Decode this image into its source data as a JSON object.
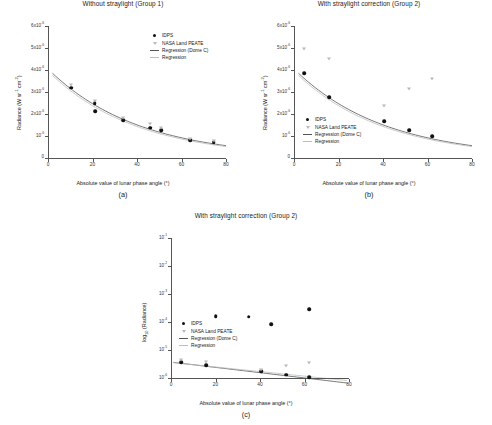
{
  "figure": {
    "panels": [
      {
        "caption": "(a)",
        "title": "Without straylight (Group 1)",
        "xlabel": "Absolute value of lunar phase angle (°)",
        "ylabel_main": "Radiance (W sr",
        "ylabel_sup1": "-1",
        "ylabel_mid": " cm",
        "ylabel_sup2": "-2",
        "ylabel_end": ")",
        "xticks": [
          "0",
          "20",
          "40",
          "60",
          "80"
        ],
        "yticks": [
          "6x10-6",
          "5x10-6",
          "4x10-6",
          "3x10-6",
          "2x10-6",
          "10-6",
          "0"
        ]
      },
      {
        "caption": "(b)",
        "title": "With straylight correction (Group 2)",
        "xlabel": "Absolute value of lunar phase angle (°)",
        "xticks": [
          "0",
          "20",
          "40",
          "60",
          "80"
        ],
        "yticks": [
          "6x10-6",
          "5x10-6",
          "4x10-6",
          "3x10-6",
          "2x10-6",
          "10-6",
          "0"
        ]
      },
      {
        "caption": "(c)",
        "title": "With straylight correction (Group 2)",
        "xlabel": "Absolute value of lunar phase angle (°)",
        "ylabel": "log10 (Radiance)",
        "xticks": [
          "0",
          "20",
          "40",
          "60",
          "80"
        ],
        "yticks": [
          "10-1",
          "10-2",
          "10-3",
          "10-4",
          "10-5",
          "10-6"
        ]
      }
    ],
    "legend": {
      "items": [
        {
          "label": "IDPS",
          "marker": "filled-circle"
        },
        {
          "label": "NASA Land PEATE",
          "marker": "open-triangle"
        },
        {
          "label": "Regression (Dome C)",
          "marker": "line-dark"
        },
        {
          "label": "Regression",
          "marker": "line-light"
        }
      ]
    },
    "colors": {
      "idps": "#111111",
      "peate": "#b9b9b9",
      "regression_dome_c": "#555555",
      "regression": "#bdbdbd",
      "axis": "#555555",
      "background": "#ffffff"
    }
  },
  "chart_data": [
    {
      "type": "scatter",
      "panel": "a",
      "title": "Without straylight (Group 1)",
      "xlabel": "Absolute value of lunar phase angle (°)",
      "ylabel": "Radiance (W sr-1 cm-2)",
      "xlim": [
        0,
        80
      ],
      "ylim": [
        0,
        6e-06
      ],
      "yscale": "linear",
      "grid": false,
      "legend_position": "top-right",
      "series": [
        {
          "name": "IDPS",
          "marker": "filled-circle",
          "points": [
            {
              "x": 10.5,
              "y": 3.2e-06
            },
            {
              "x": 21.0,
              "y": 2.48e-06
            },
            {
              "x": 21.3,
              "y": 2.13e-06
            },
            {
              "x": 33.8,
              "y": 1.73e-06
            },
            {
              "x": 46.0,
              "y": 1.38e-06
            },
            {
              "x": 51.0,
              "y": 1.27e-06
            },
            {
              "x": 63.8,
              "y": 8.2e-07
            },
            {
              "x": 74.5,
              "y": 7.3e-07
            }
          ]
        },
        {
          "name": "NASA Land PEATE",
          "marker": "open-triangle",
          "points": [
            {
              "x": 10.5,
              "y": 3.32e-06
            },
            {
              "x": 21.0,
              "y": 2.6e-06
            },
            {
              "x": 33.8,
              "y": 1.82e-06
            },
            {
              "x": 46.0,
              "y": 1.55e-06
            },
            {
              "x": 51.0,
              "y": 1.37e-06
            },
            {
              "x": 63.8,
              "y": 8.7e-07
            },
            {
              "x": 74.5,
              "y": 7.9e-07
            }
          ]
        }
      ],
      "curves": [
        {
          "name": "Regression (Dome C)",
          "y_at_x0": 4.05e-06,
          "y_at_x80": 5.6e-07
        },
        {
          "name": "Regression",
          "y_at_x0": 3.95e-06,
          "y_at_x80": 5.2e-07
        }
      ]
    },
    {
      "type": "scatter",
      "panel": "b",
      "title": "With straylight correction (Group 2)",
      "xlabel": "Absolute value of lunar phase angle (°)",
      "ylabel": "Radiance (W sr-1 cm-2)",
      "xlim": [
        0,
        80
      ],
      "ylim": [
        0,
        6e-06
      ],
      "yscale": "linear",
      "grid": false,
      "legend_position": "lower-left",
      "series": [
        {
          "name": "IDPS",
          "marker": "filled-circle",
          "points": [
            {
              "x": 4.5,
              "y": 3.85e-06
            },
            {
              "x": 15.8,
              "y": 2.76e-06
            },
            {
              "x": 40.5,
              "y": 1.68e-06
            },
            {
              "x": 51.8,
              "y": 1.27e-06
            },
            {
              "x": 62.0,
              "y": 1e-06
            }
          ]
        },
        {
          "name": "NASA Land PEATE",
          "marker": "open-triangle",
          "points": [
            {
              "x": 4.5,
              "y": 4.97e-06
            },
            {
              "x": 15.8,
              "y": 4.52e-06
            },
            {
              "x": 40.5,
              "y": 2.35e-06
            },
            {
              "x": 51.8,
              "y": 3.12e-06
            },
            {
              "x": 62.0,
              "y": 3.57e-06
            }
          ]
        }
      ],
      "curves": [
        {
          "name": "Regression (Dome C)",
          "y_at_x0": 4.05e-06,
          "y_at_x80": 5.6e-07
        },
        {
          "name": "Regression",
          "y_at_x0": 3.95e-06,
          "y_at_x80": 5.2e-07
        }
      ]
    },
    {
      "type": "scatter",
      "panel": "c",
      "title": "With straylight correction (Group 2)",
      "xlabel": "Absolute value of lunar phase angle (°)",
      "ylabel": "log10 (Radiance)",
      "xlim": [
        0,
        80
      ],
      "ylim": [
        1e-06,
        0.1
      ],
      "yscale": "log",
      "grid": false,
      "legend_position": "lower-left",
      "series": [
        {
          "name": "IDPS",
          "marker": "filled-circle",
          "points": [
            {
              "x": 4.5,
              "y": 3.7e-06
            },
            {
              "x": 15.8,
              "y": 2.8e-06
            },
            {
              "x": 20.0,
              "y": 0.00016
            },
            {
              "x": 35.0,
              "y": 0.000155
            },
            {
              "x": 40.5,
              "y": 1.75e-06
            },
            {
              "x": 45.0,
              "y": 8.5e-05
            },
            {
              "x": 51.8,
              "y": 1.3e-06
            },
            {
              "x": 62.0,
              "y": 1.05e-06
            },
            {
              "x": 62.0,
              "y": 0.00029
            }
          ]
        },
        {
          "name": "NASA Land PEATE",
          "marker": "open-triangle",
          "points": [
            {
              "x": 4.5,
              "y": 4.3e-06
            },
            {
              "x": 15.8,
              "y": 3.6e-06
            },
            {
              "x": 40.5,
              "y": 2e-06
            },
            {
              "x": 51.8,
              "y": 2.7e-06
            },
            {
              "x": 62.0,
              "y": 3.3e-06
            }
          ]
        }
      ],
      "curves": [
        {
          "name": "Regression (Dome C)",
          "y_at_x0": 3.7e-06,
          "y_at_x80": 6.5e-07
        },
        {
          "name": "Regression",
          "y_at_x0": 3.6e-06,
          "y_at_x80": 8e-07
        }
      ]
    }
  ]
}
